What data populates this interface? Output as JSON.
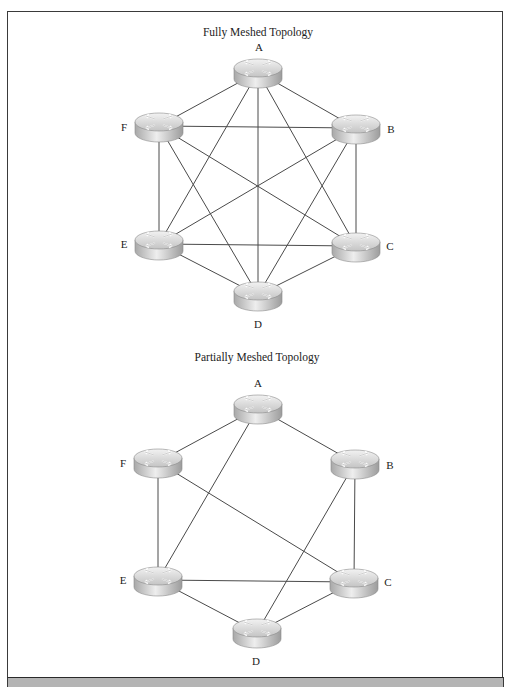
{
  "diagrams": [
    {
      "title": "Fully Meshed Topology",
      "title_pos": [
        258,
        36
      ],
      "nodes": [
        {
          "id": "A",
          "x": 258,
          "y": 72,
          "label": "A",
          "label_pos": [
            259,
            51
          ]
        },
        {
          "id": "B",
          "x": 356,
          "y": 128,
          "label": "B",
          "label_pos": [
            391,
            133
          ]
        },
        {
          "id": "C",
          "x": 356,
          "y": 246,
          "label": "C",
          "label_pos": [
            390,
            250
          ]
        },
        {
          "id": "D",
          "x": 258,
          "y": 295,
          "label": "D",
          "label_pos": [
            258,
            328
          ]
        },
        {
          "id": "E",
          "x": 159,
          "y": 244,
          "label": "E",
          "label_pos": [
            124,
            248
          ]
        },
        {
          "id": "F",
          "x": 159,
          "y": 126,
          "label": "F",
          "label_pos": [
            124,
            131
          ]
        }
      ],
      "links": [
        [
          "A",
          "B"
        ],
        [
          "A",
          "C"
        ],
        [
          "A",
          "D"
        ],
        [
          "A",
          "E"
        ],
        [
          "A",
          "F"
        ],
        [
          "B",
          "C"
        ],
        [
          "B",
          "D"
        ],
        [
          "B",
          "E"
        ],
        [
          "B",
          "F"
        ],
        [
          "C",
          "D"
        ],
        [
          "C",
          "E"
        ],
        [
          "C",
          "F"
        ],
        [
          "D",
          "E"
        ],
        [
          "D",
          "F"
        ],
        [
          "E",
          "F"
        ]
      ]
    },
    {
      "title": "Partially Meshed Topology",
      "title_pos": [
        257,
        361
      ],
      "nodes": [
        {
          "id": "A",
          "x": 258,
          "y": 408,
          "label": "A",
          "label_pos": [
            258,
            387
          ]
        },
        {
          "id": "B",
          "x": 355,
          "y": 463,
          "label": "B",
          "label_pos": [
            390,
            469
          ]
        },
        {
          "id": "C",
          "x": 354,
          "y": 582,
          "label": "C",
          "label_pos": [
            388,
            586
          ]
        },
        {
          "id": "D",
          "x": 257,
          "y": 632,
          "label": "D",
          "label_pos": [
            256,
            665
          ]
        },
        {
          "id": "E",
          "x": 158,
          "y": 580,
          "label": "E",
          "label_pos": [
            123,
            584
          ]
        },
        {
          "id": "F",
          "x": 158,
          "y": 462,
          "label": "F",
          "label_pos": [
            123,
            467
          ]
        }
      ],
      "links": [
        [
          "A",
          "B"
        ],
        [
          "A",
          "F"
        ],
        [
          "A",
          "E"
        ],
        [
          "B",
          "C"
        ],
        [
          "B",
          "D"
        ],
        [
          "C",
          "D"
        ],
        [
          "C",
          "E"
        ],
        [
          "C",
          "F"
        ],
        [
          "D",
          "E"
        ],
        [
          "E",
          "F"
        ]
      ]
    }
  ],
  "node_icon": "router-icon",
  "colors": {
    "link": "#4a4a4a",
    "router_top": "#d8d8d8",
    "router_side": "#bcbcbc",
    "footer": "#b4b4b4"
  }
}
